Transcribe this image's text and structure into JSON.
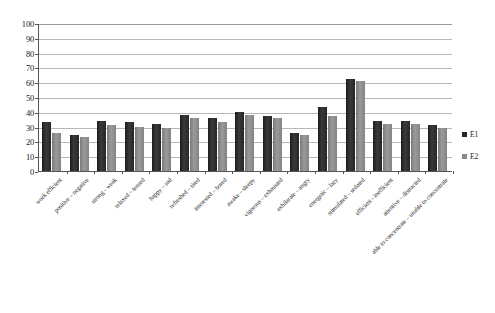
{
  "chart_data": {
    "type": "bar",
    "title": "",
    "xlabel": "",
    "ylabel": "",
    "ylim": [
      0,
      100
    ],
    "yticks": [
      0,
      10,
      20,
      30,
      40,
      50,
      60,
      70,
      80,
      90,
      100
    ],
    "grid": true,
    "legend_position": "right",
    "categories": [
      "work efficient",
      "positive – negative",
      "strong - weak",
      "relaxed – tensed",
      "happy – sad",
      "refreshed – tired",
      "interested – bored",
      "awake – sleepy",
      "vigorous – exhausted",
      "exhilarate – angry",
      "energetic – lazy",
      "stimulated – sedated",
      "efficient - inefficient",
      "attentive – distracted",
      "able to concentrate – unable to concentrate"
    ],
    "series": [
      {
        "name": "E1",
        "color": "#262626",
        "values": [
          33,
          24,
          34,
          33,
          32,
          38,
          36,
          40,
          37,
          26,
          43,
          62,
          34,
          34,
          31
        ]
      },
      {
        "name": "E2",
        "color": "#8a8a8a",
        "values": [
          26,
          23,
          31,
          30,
          29,
          36,
          33,
          38,
          36,
          24,
          37,
          61,
          32,
          32,
          29
        ]
      }
    ]
  },
  "legend": {
    "entries": [
      {
        "label": "E1"
      },
      {
        "label": "E2"
      }
    ]
  }
}
